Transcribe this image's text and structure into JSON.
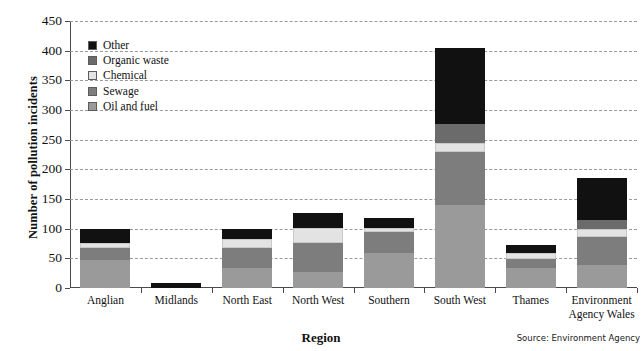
{
  "chart_data": {
    "type": "bar",
    "stacked": true,
    "title": "",
    "xlabel": "Region",
    "ylabel": "Number of pollution incidents",
    "ylim": [
      0,
      450
    ],
    "ytick_step": 50,
    "yticks": [
      "450",
      "400",
      "350",
      "300",
      "250",
      "200",
      "150",
      "100",
      "50",
      "0"
    ],
    "grid": true,
    "legend_position": "inside-top-left",
    "categories": [
      "Anglian",
      "Midlands",
      "North East",
      "North West",
      "Southern",
      "South West",
      "Thames",
      "Environment Agency Wales"
    ],
    "series": [
      {
        "name": "Oil and fuel",
        "color": "#9a9a9a",
        "values": [
          47,
          0,
          34,
          27,
          59,
          140,
          34,
          39
        ]
      },
      {
        "name": "Sewage",
        "color": "#7d7d7d",
        "values": [
          20,
          0,
          33,
          49,
          35,
          89,
          15,
          47
        ]
      },
      {
        "name": "Chemical",
        "color": "#e3e3e3",
        "values": [
          9,
          0,
          15,
          25,
          7,
          15,
          10,
          13
        ]
      },
      {
        "name": "Organic waste",
        "color": "#6b6b6b",
        "values": [
          0,
          0,
          0,
          0,
          0,
          33,
          0,
          15
        ]
      },
      {
        "name": "Other",
        "color": "#111111",
        "values": [
          24,
          9,
          17,
          26,
          17,
          128,
          13,
          71
        ]
      }
    ],
    "totals": [
      100,
      9,
      99,
      127,
      118,
      405,
      72,
      185
    ],
    "source_note": "Source: Environment Agency"
  },
  "legend": {
    "items": [
      {
        "label": "Other",
        "color": "#111111"
      },
      {
        "label": "Organic waste",
        "color": "#6b6b6b"
      },
      {
        "label": "Chemical",
        "color": "#e3e3e3"
      },
      {
        "label": "Sewage",
        "color": "#7d7d7d"
      },
      {
        "label": "Oil and fuel",
        "color": "#9a9a9a"
      }
    ]
  }
}
